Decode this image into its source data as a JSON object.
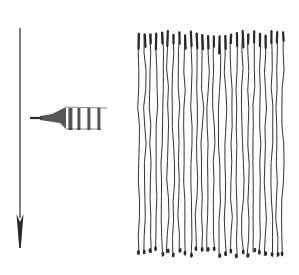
{
  "figure": {
    "width": 299,
    "height": 275,
    "background": "#ffffff",
    "ink": "#2a2a2a",
    "arrow": {
      "x": 20,
      "y_start": 28,
      "y_end": 248,
      "direction": "down",
      "head_length": 34,
      "head_width": 7
    },
    "instrument": {
      "kind": "pipette-tip",
      "direction": "left",
      "tip_x": 30,
      "base_x": 107,
      "center_y": 118,
      "body_top": 107,
      "body_bottom": 129,
      "bands_x": [
        70,
        79,
        89,
        99
      ]
    },
    "fibers": {
      "count": 26,
      "x_start": 139,
      "x_end": 283,
      "y_top": 34,
      "y_bottom": 254
    }
  }
}
